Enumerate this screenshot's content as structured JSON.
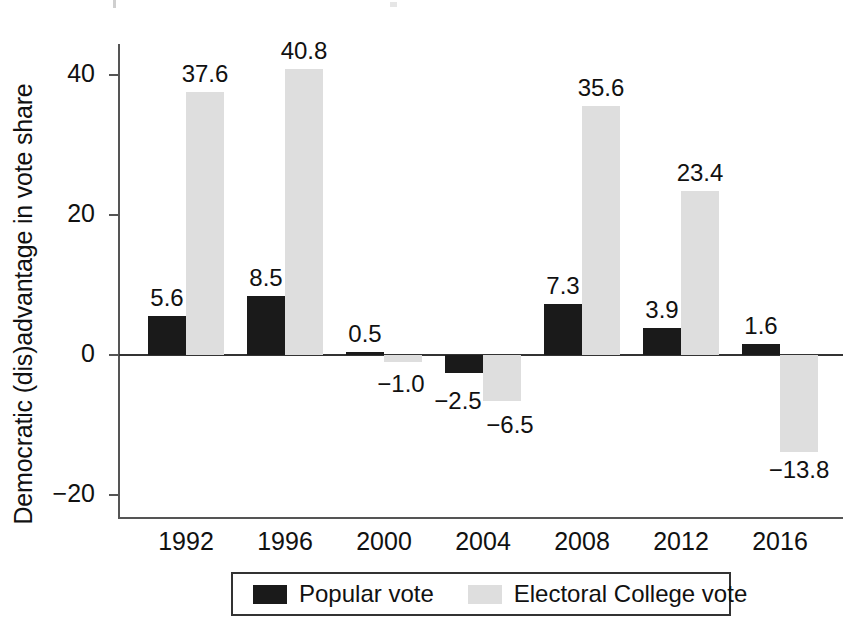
{
  "chart_data": {
    "type": "bar",
    "title": "",
    "xlabel": "",
    "ylabel": "Democratic (dis)advantage in vote share",
    "categories": [
      "1992",
      "1996",
      "2000",
      "2004",
      "2008",
      "2012",
      "2016"
    ],
    "series": [
      {
        "name": "Popular vote",
        "color": "#1a1a1a",
        "values": [
          5.6,
          8.5,
          0.5,
          -2.5,
          7.3,
          3.9,
          1.6
        ],
        "labels": [
          "5.6",
          "8.5",
          "0.5",
          "−2.5",
          "7.3",
          "3.9",
          "1.6"
        ]
      },
      {
        "name": "Electoral College vote",
        "color": "#dedede",
        "values": [
          37.6,
          40.8,
          -1.0,
          -6.5,
          35.6,
          23.4,
          -13.8
        ],
        "labels": [
          "37.6",
          "40.8",
          "−1.0",
          "−6.5",
          "35.6",
          "23.4",
          "−13.8"
        ]
      }
    ],
    "ylim": [
      -24,
      46
    ],
    "yticks": [
      40,
      20,
      0,
      -20
    ],
    "ytick_labels": [
      "40",
      "20",
      "0",
      "−20"
    ],
    "grid": false,
    "legend_position": "bottom-center"
  },
  "legend": {
    "entries": [
      {
        "label": "Popular vote",
        "swatch": "popular-vote-swatch"
      },
      {
        "label": "Electoral College vote",
        "swatch": "electoral-college-vote-swatch"
      }
    ]
  }
}
